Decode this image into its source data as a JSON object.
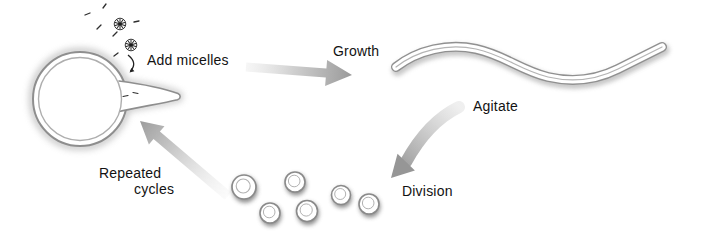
{
  "labels": {
    "add_micelles": "Add micelles",
    "growth": "Growth",
    "agitate": "Agitate",
    "division": "Division",
    "repeated_cycles_line1": "Repeated",
    "repeated_cycles_line2": "cycles"
  },
  "icons": {
    "micelle": "spoked-wheel-micelle-glyph",
    "parent_vesicle": "large-ring-vesicle-with-protrusion",
    "tubular_vesicle": "elongated-worm-shaped-vesicle",
    "daughter_vesicle": "small-ring-vesicle",
    "surfactant": "short-dash-molecule",
    "arrows": [
      "add-micelles-arrow",
      "growth-arrow",
      "agitate-arrow",
      "repeated-cycles-arrow"
    ]
  },
  "counts": {
    "micelles": 2,
    "daughter_vesicles": 6,
    "surfactant_dashes": 6
  },
  "colors": {
    "background": "#ffffff",
    "text": "#121212",
    "membrane_outline": "#8e8e8e",
    "membrane_inner_line": "#aeaeae",
    "glow": "#c8c8c8",
    "arrow_light": "#ececec",
    "arrow_dark": "#9a9a9a",
    "glyph_dark": "#2a2a2a",
    "daughter_shadow": "#6a6a6a"
  }
}
